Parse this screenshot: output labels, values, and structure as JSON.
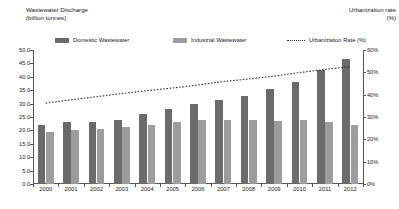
{
  "left_axis_title": "Wastewater Discharge\n(billion tonnes)",
  "right_axis_title": "Urbanization rate\n(%)",
  "legend": {
    "domestic": "Domestic Wastewater",
    "industrial": "Industrial Wastewater",
    "urbanization": "Urbanization Rate (%)"
  },
  "colors": {
    "domestic": "#6b6b6b",
    "industrial": "#9d9d9d",
    "urbanization_line": "#333333",
    "axis": "#555555"
  },
  "chart_data": {
    "type": "bar",
    "xlabel": "",
    "ylabel": "Wastewater Discharge (billion tonnes)",
    "y2label": "Urbanization rate (%)",
    "ylim": [
      0,
      50
    ],
    "y2lim": [
      0,
      60
    ],
    "grid": false,
    "legend_position": "top",
    "categories": [
      "2000",
      "2001",
      "2002",
      "2003",
      "2004",
      "2005",
      "2006",
      "2007",
      "2008",
      "2009",
      "2010",
      "2011",
      "2012"
    ],
    "y_ticks": [
      "0.0",
      "5.0",
      "10.0",
      "15.0",
      "20.0",
      "25.0",
      "30.0",
      "35.0",
      "40.0",
      "45.0",
      "50.0"
    ],
    "y2_ticks": [
      "0%",
      "10%",
      "20%",
      "30%",
      "40%",
      "50%",
      "60%"
    ],
    "series": [
      {
        "name": "Domestic Wastewater",
        "type": "bar",
        "axis": "left",
        "color": "#6b6b6b",
        "values": [
          22.0,
          23.0,
          23.2,
          24.0,
          26.2,
          28.1,
          29.7,
          31.2,
          33.0,
          35.5,
          37.9,
          42.7,
          46.5
        ]
      },
      {
        "name": "Industrial Wastewater",
        "type": "bar",
        "axis": "left",
        "color": "#9d9d9d",
        "values": [
          19.4,
          20.3,
          20.6,
          21.2,
          22.1,
          23.2,
          24.0,
          24.0,
          24.0,
          23.5,
          23.7,
          23.0,
          22.1
        ]
      },
      {
        "name": "Urbanization Rate (%)",
        "type": "line",
        "axis": "right",
        "color": "#333333",
        "style": "dotted",
        "values": [
          36.2,
          37.7,
          39.1,
          40.5,
          41.8,
          43.0,
          44.3,
          45.9,
          47.0,
          48.3,
          49.9,
          51.3,
          52.6
        ]
      }
    ]
  }
}
